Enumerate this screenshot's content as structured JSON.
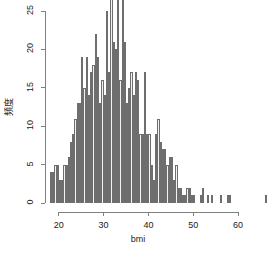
{
  "chart_data": {
    "type": "bar",
    "title": "",
    "subtitle": "",
    "xlabel": "bmi",
    "ylabel": "頻度",
    "xlim": [
      17.5,
      67.5
    ],
    "ylim": [
      0,
      27
    ],
    "grid": false,
    "legend": null,
    "xticks": [
      20,
      30,
      40,
      50,
      60
    ],
    "xtick_labels": [
      "20",
      "30",
      "40",
      "50",
      "60"
    ],
    "yticks": [
      0,
      5,
      10,
      15,
      20,
      25
    ],
    "ytick_labels": [
      "0",
      "5",
      "10",
      "15",
      "20",
      "25"
    ],
    "bin_width": 0.5,
    "bar_fill_color": "#f2f2f2",
    "bar_edge_color": "#6e6e6e",
    "axis_color": "#808080",
    "text_color": "#1a1a1a",
    "background_color": "#ffffff",
    "categories": [
      18.0,
      18.5,
      19.0,
      19.5,
      20.0,
      20.5,
      21.0,
      21.5,
      22.0,
      22.5,
      23.0,
      23.5,
      24.0,
      24.5,
      25.0,
      25.5,
      26.0,
      26.5,
      27.0,
      27.5,
      28.0,
      28.5,
      29.0,
      29.5,
      30.0,
      30.5,
      31.0,
      31.5,
      32.0,
      32.5,
      33.0,
      33.5,
      34.0,
      34.5,
      35.0,
      35.5,
      36.0,
      36.5,
      37.0,
      37.5,
      38.0,
      38.5,
      39.0,
      39.5,
      40.0,
      40.5,
      41.0,
      41.5,
      42.0,
      42.5,
      43.0,
      43.5,
      44.0,
      44.5,
      45.0,
      45.5,
      46.0,
      46.5,
      47.0,
      47.5,
      48.0,
      48.5,
      49.0,
      49.5,
      50.0,
      50.5,
      51.0,
      51.5,
      52.0,
      52.5,
      53.0,
      53.5,
      54.0,
      54.5,
      55.0,
      55.5,
      56.0,
      56.5,
      57.0,
      57.5,
      58.0,
      58.5,
      59.0,
      59.5,
      60.0,
      60.5,
      61.0,
      61.5,
      62.0,
      62.5,
      63.0,
      63.5,
      64.0,
      64.5,
      65.0,
      65.5,
      66.0,
      66.5
    ],
    "values": [
      4,
      4,
      5,
      5,
      3,
      3,
      5,
      5,
      6,
      8,
      9,
      11,
      13,
      13,
      19,
      15,
      19,
      14,
      17,
      18,
      22,
      19,
      13,
      16,
      14,
      25,
      17,
      27,
      21,
      20,
      27,
      16,
      27,
      21,
      13,
      15,
      17,
      14,
      17,
      16,
      9,
      9,
      17,
      9,
      9,
      5,
      3,
      9,
      11,
      8,
      7,
      7,
      5,
      6,
      6,
      3,
      5,
      2,
      2,
      1,
      1,
      2,
      2,
      1,
      1,
      0,
      0,
      1,
      2,
      0,
      1,
      0,
      1,
      0,
      0,
      0,
      1,
      0,
      0,
      1,
      1,
      0,
      0,
      0,
      0,
      0,
      0,
      0,
      0,
      0,
      0,
      0,
      0,
      0,
      0,
      0,
      1,
      0
    ]
  },
  "plot": {
    "x_axis_name": "x-axis",
    "y_axis_name": "y-axis"
  }
}
